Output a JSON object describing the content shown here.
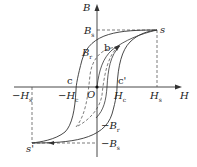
{
  "diagram": {
    "type": "magnetic-hysteresis-loop",
    "axes": {
      "x_label": "H",
      "y_label": "B"
    },
    "labels": {
      "origin": "O",
      "Bs": "B",
      "Bs_sub": "s",
      "Br": "B",
      "Br_sub": "r",
      "neg_Br": "−B",
      "neg_Br_sub": "r",
      "neg_Bs": "−B",
      "neg_Bs_sub": "s",
      "Hs": "H",
      "Hs_sub": "s",
      "neg_Hs": "−H",
      "neg_Hs_sub": "s",
      "Hc": "H",
      "Hc_sub": "c",
      "neg_Hc": "−H",
      "neg_Hc_sub": "c",
      "point_s": "s",
      "point_s_prime": "s'",
      "point_b": "b",
      "point_c": "c",
      "point_c_prime": "c'"
    },
    "colors": {
      "line": "#333333",
      "text": "#222222"
    }
  }
}
